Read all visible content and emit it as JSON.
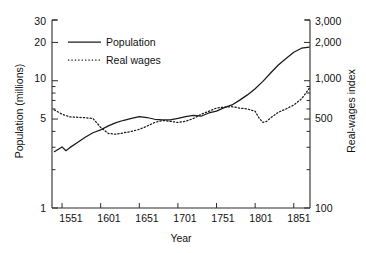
{
  "chart_data": {
    "type": "line",
    "title": "",
    "xlabel": "Year",
    "ylabel": "Population (millions)",
    "y2label": "Real-wages index",
    "xlim": [
      1538,
      1872
    ],
    "ylim": [
      1,
      30
    ],
    "y2lim": [
      100,
      3000
    ],
    "yscale": "log",
    "y2scale": "log",
    "grid": false,
    "legend_position": "upper-left-inside",
    "xticks": [
      1551,
      1601,
      1651,
      1701,
      1751,
      1801,
      1851
    ],
    "xtick_labels": [
      "1551",
      "1601",
      "1651",
      "1701",
      "1751",
      "1801",
      "1851"
    ],
    "yticks": [
      1,
      5,
      10,
      20,
      30
    ],
    "ytick_labels": [
      "1",
      "5",
      "10",
      "20",
      "30"
    ],
    "y2ticks": [
      100,
      500,
      1000,
      2000,
      3000
    ],
    "y2tick_labels": [
      "100",
      "500",
      "1,000",
      "2,000",
      "3,000"
    ],
    "series": [
      {
        "name": "Population",
        "axis": "left",
        "style": "solid",
        "color": "#1a1a1a",
        "units": "millions",
        "x": [
          1541,
          1551,
          1556,
          1561,
          1571,
          1581,
          1591,
          1601,
          1611,
          1621,
          1631,
          1641,
          1651,
          1661,
          1671,
          1681,
          1691,
          1701,
          1711,
          1721,
          1731,
          1741,
          1751,
          1761,
          1771,
          1781,
          1791,
          1801,
          1811,
          1821,
          1831,
          1841,
          1851,
          1861,
          1871
        ],
        "values": [
          2.77,
          3.02,
          2.82,
          2.98,
          3.27,
          3.6,
          3.9,
          4.11,
          4.42,
          4.69,
          4.89,
          5.07,
          5.23,
          5.14,
          4.98,
          4.93,
          4.93,
          5.06,
          5.23,
          5.35,
          5.26,
          5.58,
          5.77,
          6.15,
          6.45,
          7.04,
          7.74,
          8.66,
          9.89,
          11.49,
          13.28,
          14.97,
          16.74,
          18.0,
          18.4
        ]
      },
      {
        "name": "Real wages",
        "axis": "right",
        "style": "dotted",
        "color": "#1a1a1a",
        "units": "index",
        "x": [
          1541,
          1551,
          1561,
          1571,
          1581,
          1591,
          1601,
          1611,
          1621,
          1631,
          1641,
          1651,
          1661,
          1671,
          1681,
          1691,
          1701,
          1711,
          1721,
          1731,
          1741,
          1751,
          1761,
          1771,
          1781,
          1791,
          1801,
          1806,
          1811,
          1816,
          1821,
          1831,
          1841,
          1851,
          1861,
          1871
        ],
        "values": [
          590,
          545,
          520,
          516,
          512,
          505,
          430,
          385,
          380,
          390,
          400,
          415,
          440,
          470,
          487,
          480,
          470,
          480,
          505,
          545,
          575,
          610,
          620,
          625,
          610,
          600,
          575,
          510,
          470,
          480,
          510,
          565,
          600,
          645,
          720,
          870
        ]
      }
    ]
  },
  "legend": {
    "items": [
      {
        "label": "Population",
        "style": "solid"
      },
      {
        "label": "Real wages",
        "style": "dotted"
      }
    ]
  }
}
